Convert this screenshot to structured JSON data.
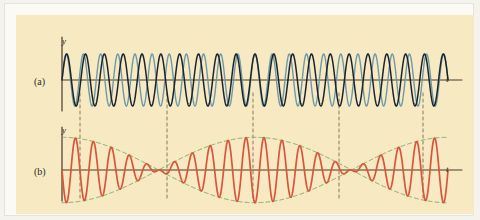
{
  "figure": {
    "background_color": "#f7e9c2",
    "frame_color": "#fbfaf5",
    "panels": [
      {
        "key": "a",
        "label": "(a)",
        "y_axis_label": "y",
        "x_axis_label": "t",
        "description": "Two superimposed sinusoidal waves of slightly different frequency"
      },
      {
        "key": "b",
        "label": "(b)",
        "y_axis_label": "y",
        "x_axis_label": "t",
        "description": "Resultant beat waveform with dashed amplitude envelope"
      }
    ],
    "colors": {
      "wave1": "#1b2430",
      "wave2": "#6e9aa8",
      "resultant": "#d9553c",
      "envelope": "#7fa86b",
      "axis": "#4a3a2a",
      "guide": "#8a7a5a"
    }
  },
  "chart_data": {
    "type": "line",
    "title": "",
    "xlabel": "t",
    "ylabel": "y",
    "xlim": [
      0,
      1
    ],
    "ylim": [
      -2.2,
      2.2
    ],
    "grid": false,
    "legend": "none",
    "panels": [
      {
        "name": "(a)",
        "x_axis_label": "t",
        "y_axis_label": "y",
        "series": [
          {
            "name": "wave1",
            "type": "sine",
            "color": "#1b2430",
            "amplitude": 1.0,
            "cycles": 20.5,
            "phase": 0.0
          },
          {
            "name": "wave2",
            "type": "sine",
            "color": "#6e9aa8",
            "amplitude": 1.0,
            "cycles": 22.5,
            "phase": 0.0
          }
        ]
      },
      {
        "name": "(b)",
        "x_axis_label": "t",
        "y_axis_label": "y",
        "series": [
          {
            "name": "resultant",
            "type": "beat-sum",
            "color": "#d9553c",
            "amplitude": 2.0,
            "carrier_cycles": 21.5,
            "envelope_cycles": 1.0,
            "phase": 0.0
          },
          {
            "name": "envelope-upper",
            "type": "envelope",
            "color": "#7fa86b",
            "dashed": true,
            "amplitude": 2.0
          },
          {
            "name": "envelope-lower",
            "type": "envelope",
            "color": "#7fa86b",
            "dashed": true,
            "amplitude": -2.0
          }
        ]
      }
    ],
    "guide_lines": {
      "color": "#8a7a5a",
      "dashed": true,
      "x_positions": [
        64,
        151,
        237,
        323,
        407
      ],
      "meaning": [
        "beat node",
        "beat antinode",
        "beat node",
        "beat antinode",
        "beat node"
      ]
    }
  }
}
